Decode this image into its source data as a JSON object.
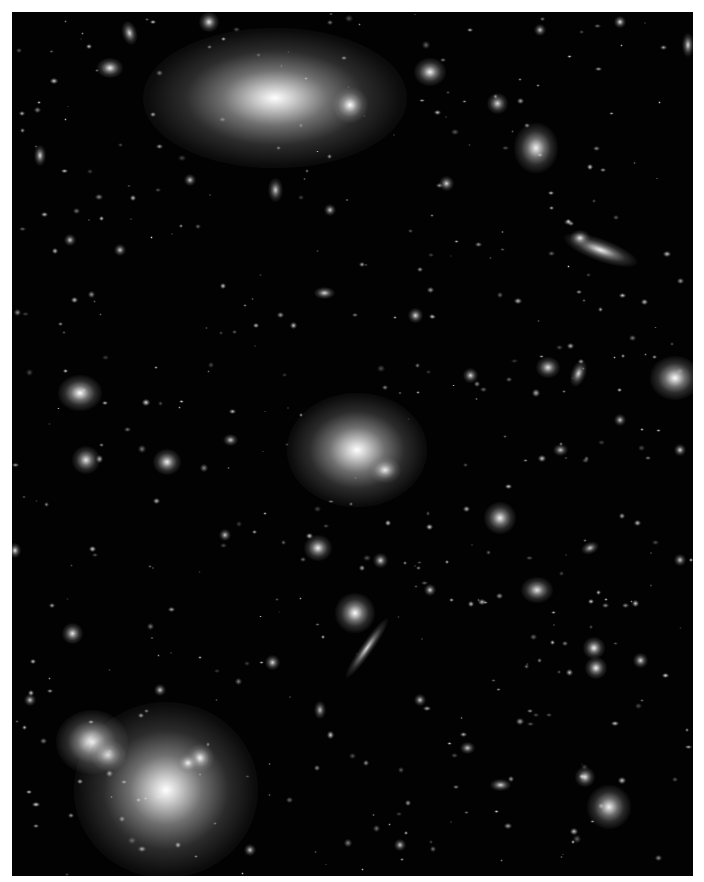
{
  "image": {
    "subject": "deep-field galaxy cluster (grayscale)",
    "frame": {
      "x": 12,
      "y": 12,
      "w": 681,
      "h": 864
    },
    "background_color": "#020202",
    "border_color": "#ffffff"
  },
  "objects": [
    {
      "x": 275,
      "y": 98,
      "rx": 60,
      "ry": 32,
      "rot": 0,
      "b": 1.0,
      "halo": 2.2
    },
    {
      "x": 350,
      "y": 105,
      "rx": 9,
      "ry": 9,
      "rot": 0,
      "b": 1.0,
      "halo": 2
    },
    {
      "x": 430,
      "y": 72,
      "rx": 9,
      "ry": 8,
      "rot": 0,
      "b": 0.95,
      "halo": 1.8
    },
    {
      "x": 536,
      "y": 148,
      "rx": 12,
      "ry": 14,
      "rot": 0,
      "b": 0.95,
      "halo": 1.8
    },
    {
      "x": 600,
      "y": 250,
      "rx": 24,
      "ry": 7,
      "rot": 20,
      "b": 0.95,
      "halo": 1.6
    },
    {
      "x": 580,
      "y": 238,
      "rx": 6,
      "ry": 5,
      "rot": 0,
      "b": 0.9,
      "halo": 1.6
    },
    {
      "x": 675,
      "y": 378,
      "rx": 14,
      "ry": 12,
      "rot": 0,
      "b": 1.0,
      "halo": 1.8
    },
    {
      "x": 357,
      "y": 450,
      "rx": 32,
      "ry": 26,
      "rot": 0,
      "b": 1.0,
      "halo": 2.2
    },
    {
      "x": 385,
      "y": 470,
      "rx": 10,
      "ry": 8,
      "rot": 0,
      "b": 0.9,
      "halo": 1.6
    },
    {
      "x": 80,
      "y": 393,
      "rx": 12,
      "ry": 10,
      "rot": 0,
      "b": 1.0,
      "halo": 1.8
    },
    {
      "x": 86,
      "y": 460,
      "rx": 9,
      "ry": 9,
      "rot": 0,
      "b": 0.9,
      "halo": 1.6
    },
    {
      "x": 167,
      "y": 462,
      "rx": 9,
      "ry": 8,
      "rot": 0,
      "b": 0.95,
      "halo": 1.6
    },
    {
      "x": 500,
      "y": 518,
      "rx": 10,
      "ry": 10,
      "rot": 0,
      "b": 0.95,
      "halo": 1.6
    },
    {
      "x": 318,
      "y": 548,
      "rx": 9,
      "ry": 8,
      "rot": 0,
      "b": 0.95,
      "halo": 1.6
    },
    {
      "x": 355,
      "y": 613,
      "rx": 11,
      "ry": 11,
      "rot": 0,
      "b": 1.0,
      "halo": 1.8
    },
    {
      "x": 367,
      "y": 648,
      "rx": 24,
      "ry": 4,
      "rot": -55,
      "b": 0.85,
      "halo": 1.5
    },
    {
      "x": 537,
      "y": 590,
      "rx": 10,
      "ry": 8,
      "rot": 0,
      "b": 0.9,
      "halo": 1.6
    },
    {
      "x": 594,
      "y": 648,
      "rx": 7,
      "ry": 7,
      "rot": 0,
      "b": 0.95,
      "halo": 1.6
    },
    {
      "x": 596,
      "y": 668,
      "rx": 7,
      "ry": 7,
      "rot": 0,
      "b": 0.95,
      "halo": 1.6
    },
    {
      "x": 92,
      "y": 742,
      "rx": 18,
      "ry": 16,
      "rot": 0,
      "b": 1.0,
      "halo": 2
    },
    {
      "x": 108,
      "y": 755,
      "rx": 10,
      "ry": 9,
      "rot": 0,
      "b": 0.95,
      "halo": 1.8
    },
    {
      "x": 166,
      "y": 790,
      "rx": 42,
      "ry": 40,
      "rot": 0,
      "b": 1.0,
      "halo": 2.2
    },
    {
      "x": 200,
      "y": 758,
      "rx": 9,
      "ry": 9,
      "rot": 0,
      "b": 0.95,
      "halo": 1.6
    },
    {
      "x": 188,
      "y": 763,
      "rx": 7,
      "ry": 6,
      "rot": 0,
      "b": 0.9,
      "halo": 1.6
    },
    {
      "x": 609,
      "y": 807,
      "rx": 12,
      "ry": 12,
      "rot": 0,
      "b": 0.95,
      "halo": 1.8
    },
    {
      "x": 585,
      "y": 777,
      "rx": 6,
      "ry": 6,
      "rot": 0,
      "b": 0.9,
      "halo": 1.6
    },
    {
      "x": 129,
      "y": 33,
      "rx": 5,
      "ry": 8,
      "rot": -15,
      "b": 0.85,
      "halo": 1.5
    },
    {
      "x": 209,
      "y": 22,
      "rx": 6,
      "ry": 6,
      "rot": 0,
      "b": 0.9,
      "halo": 1.6
    },
    {
      "x": 110,
      "y": 68,
      "rx": 8,
      "ry": 6,
      "rot": 0,
      "b": 0.95,
      "halo": 1.6
    },
    {
      "x": 497,
      "y": 103,
      "rx": 7,
      "ry": 7,
      "rot": 0,
      "b": 0.85,
      "halo": 1.5
    },
    {
      "x": 578,
      "y": 373,
      "rx": 5,
      "ry": 9,
      "rot": 20,
      "b": 0.85,
      "halo": 1.5
    },
    {
      "x": 548,
      "y": 367,
      "rx": 8,
      "ry": 7,
      "rot": 0,
      "b": 0.9,
      "halo": 1.5
    },
    {
      "x": 324,
      "y": 293,
      "rx": 7,
      "ry": 4,
      "rot": 0,
      "b": 0.85,
      "halo": 1.5
    },
    {
      "x": 275,
      "y": 190,
      "rx": 5,
      "ry": 8,
      "rot": 0,
      "b": 0.8,
      "halo": 1.5
    },
    {
      "x": 72,
      "y": 633,
      "rx": 7,
      "ry": 7,
      "rot": 0,
      "b": 0.9,
      "halo": 1.5
    },
    {
      "x": 272,
      "y": 662,
      "rx": 5,
      "ry": 5,
      "rot": 0,
      "b": 0.85,
      "halo": 1.5
    },
    {
      "x": 467,
      "y": 748,
      "rx": 5,
      "ry": 4,
      "rot": 0,
      "b": 0.8,
      "halo": 1.5
    },
    {
      "x": 500,
      "y": 785,
      "rx": 7,
      "ry": 4,
      "rot": 0,
      "b": 0.85,
      "halo": 1.5
    },
    {
      "x": 40,
      "y": 155,
      "rx": 4,
      "ry": 7,
      "rot": 0,
      "b": 0.85,
      "halo": 1.5
    },
    {
      "x": 688,
      "y": 45,
      "rx": 4,
      "ry": 8,
      "rot": 0,
      "b": 0.85,
      "halo": 1.5
    },
    {
      "x": 620,
      "y": 22,
      "rx": 4,
      "ry": 4,
      "rot": 0,
      "b": 0.9,
      "halo": 1.5
    },
    {
      "x": 446,
      "y": 183,
      "rx": 5,
      "ry": 5,
      "rot": 0,
      "b": 0.85,
      "halo": 1.5
    },
    {
      "x": 15,
      "y": 550,
      "rx": 4,
      "ry": 5,
      "rot": 0,
      "b": 0.9,
      "halo": 1.5
    },
    {
      "x": 470,
      "y": 375,
      "rx": 5,
      "ry": 5,
      "rot": 0,
      "b": 0.85,
      "halo": 1.5
    },
    {
      "x": 415,
      "y": 315,
      "rx": 5,
      "ry": 5,
      "rot": 0,
      "b": 0.85,
      "halo": 1.5
    },
    {
      "x": 230,
      "y": 440,
      "rx": 5,
      "ry": 4,
      "rot": 0,
      "b": 0.8,
      "halo": 1.5
    },
    {
      "x": 640,
      "y": 660,
      "rx": 5,
      "ry": 5,
      "rot": 0,
      "b": 0.85,
      "halo": 1.5
    },
    {
      "x": 225,
      "y": 535,
      "rx": 4,
      "ry": 4,
      "rot": 0,
      "b": 0.8,
      "halo": 1.5
    },
    {
      "x": 430,
      "y": 590,
      "rx": 4,
      "ry": 4,
      "rot": 0,
      "b": 0.85,
      "halo": 1.5
    },
    {
      "x": 380,
      "y": 560,
      "rx": 5,
      "ry": 5,
      "rot": 0,
      "b": 0.85,
      "halo": 1.5
    },
    {
      "x": 680,
      "y": 450,
      "rx": 4,
      "ry": 4,
      "rot": 0,
      "b": 0.85,
      "halo": 1.5
    },
    {
      "x": 590,
      "y": 548,
      "rx": 6,
      "ry": 4,
      "rot": -20,
      "b": 0.8,
      "halo": 1.5
    },
    {
      "x": 120,
      "y": 250,
      "rx": 4,
      "ry": 4,
      "rot": 0,
      "b": 0.8,
      "halo": 1.5
    },
    {
      "x": 190,
      "y": 180,
      "rx": 4,
      "ry": 4,
      "rot": 0,
      "b": 0.8,
      "halo": 1.5
    },
    {
      "x": 70,
      "y": 240,
      "rx": 4,
      "ry": 4,
      "rot": 0,
      "b": 0.8,
      "halo": 1.5
    },
    {
      "x": 560,
      "y": 450,
      "rx": 5,
      "ry": 4,
      "rot": 0,
      "b": 0.8,
      "halo": 1.5
    },
    {
      "x": 620,
      "y": 420,
      "rx": 4,
      "ry": 4,
      "rot": 0,
      "b": 0.8,
      "halo": 1.5
    },
    {
      "x": 420,
      "y": 700,
      "rx": 4,
      "ry": 4,
      "rot": 0,
      "b": 0.8,
      "halo": 1.5
    },
    {
      "x": 320,
      "y": 710,
      "rx": 4,
      "ry": 6,
      "rot": 0,
      "b": 0.75,
      "halo": 1.5
    },
    {
      "x": 160,
      "y": 690,
      "rx": 4,
      "ry": 4,
      "rot": 0,
      "b": 0.8,
      "halo": 1.5
    },
    {
      "x": 250,
      "y": 850,
      "rx": 4,
      "ry": 4,
      "rot": 0,
      "b": 0.8,
      "halo": 1.5
    },
    {
      "x": 400,
      "y": 845,
      "rx": 4,
      "ry": 4,
      "rot": 0,
      "b": 0.8,
      "halo": 1.5
    },
    {
      "x": 680,
      "y": 560,
      "rx": 4,
      "ry": 4,
      "rot": 0,
      "b": 0.8,
      "halo": 1.5
    },
    {
      "x": 540,
      "y": 30,
      "rx": 4,
      "ry": 4,
      "rot": 0,
      "b": 0.8,
      "halo": 1.5
    },
    {
      "x": 330,
      "y": 210,
      "rx": 4,
      "ry": 4,
      "rot": 0,
      "b": 0.8,
      "halo": 1.5
    },
    {
      "x": 30,
      "y": 700,
      "rx": 4,
      "ry": 4,
      "rot": 0,
      "b": 0.8,
      "halo": 1.5
    }
  ]
}
